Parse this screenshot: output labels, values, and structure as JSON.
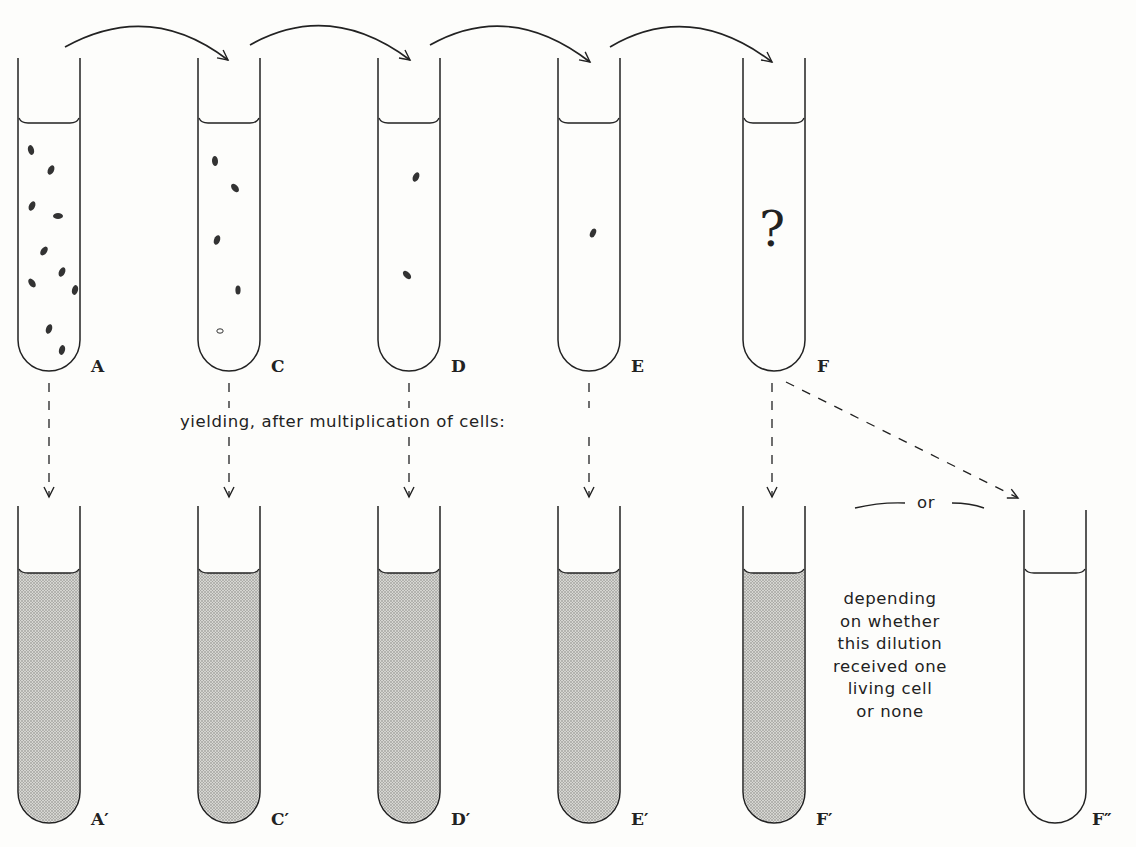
{
  "caption_middle": "yielding, after multiplication of cells:",
  "or_label": "or",
  "note_lines": [
    "depending",
    "on whether",
    "this dilution",
    "received one",
    "living cell",
    "or none"
  ],
  "unknown_mark": "?",
  "top_tubes": [
    {
      "label": "A",
      "cells": 12
    },
    {
      "label": "C",
      "cells": 5
    },
    {
      "label": "D",
      "cells": 2
    },
    {
      "label": "E",
      "cells": 1
    },
    {
      "label": "F",
      "cells": "?"
    }
  ],
  "bottom_tubes": [
    {
      "label": "A′",
      "state": "turbid"
    },
    {
      "label": "C′",
      "state": "turbid"
    },
    {
      "label": "D′",
      "state": "turbid"
    },
    {
      "label": "E′",
      "state": "turbid"
    },
    {
      "label": "F′",
      "state": "turbid"
    },
    {
      "label": "F″",
      "state": "clear"
    }
  ],
  "colors": {
    "ink": "#222222",
    "paper": "#fdfdfb",
    "culture_fill": "#c9c9c6"
  }
}
